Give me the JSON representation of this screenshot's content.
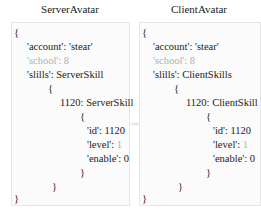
{
  "left": {
    "title": "ServerAvatar",
    "open_brace": "{",
    "account_key": "'account': ",
    "account_val": "'stear'",
    "school": "'school': 8",
    "skills_line": "'slills': ServerSkill",
    "skills_open": "{",
    "skill_entry": "1120: ServerSkill",
    "entry_open": "{",
    "id_line": "'id': 1120",
    "level_key": "'level': ",
    "level_val": "1",
    "enable_line": "'enable': 0",
    "entry_close": "}",
    "skills_close": "}",
    "close_brace": "}"
  },
  "right": {
    "title": "ClientAvatar",
    "open_brace": "{",
    "account_key": "'account': ",
    "account_val": "'stear'",
    "school": "'school': 8",
    "skills_line": "'slills': ClientSkills",
    "skills_open": "{",
    "skill_entry": "1120: ClientSkill",
    "entry_open": "{",
    "id_line": "'id': 1120",
    "level_key": "'level': ",
    "level_val": "1",
    "enable_line": "'enable': 0",
    "entry_close": "}",
    "skills_close": "}",
    "close_brace": "}"
  },
  "connector": "<=>",
  "colors": {
    "muted": "#b0b0b0",
    "border": "#e6e6e6",
    "panel_bg": "#fbfbfb"
  }
}
